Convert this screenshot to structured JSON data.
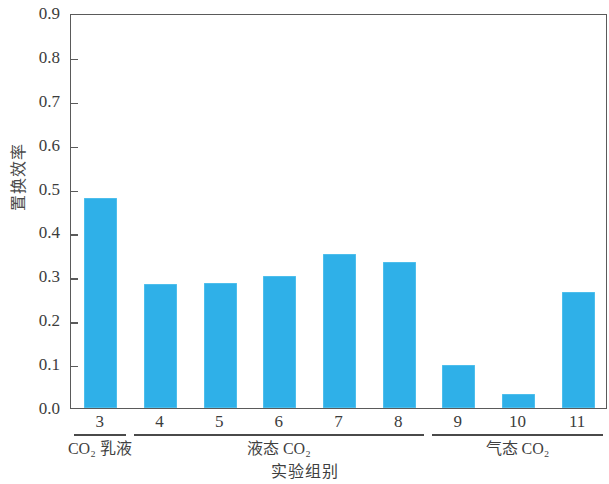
{
  "chart_data": {
    "type": "bar",
    "title": "",
    "xlabel": "实验组别",
    "ylabel": "置换效率",
    "categories": [
      "3",
      "4",
      "5",
      "6",
      "7",
      "8",
      "9",
      "10",
      "11"
    ],
    "values": [
      0.478,
      0.283,
      0.284,
      0.3,
      0.35,
      0.332,
      0.098,
      0.032,
      0.264
    ],
    "series": [
      {
        "name": "置换效率",
        "values": [
          0.478,
          0.283,
          0.284,
          0.3,
          0.35,
          0.332,
          0.098,
          0.032,
          0.264
        ]
      }
    ],
    "ylim": [
      0.0,
      0.9
    ],
    "ytick_labels": [
      "0.0",
      "0.1",
      "0.2",
      "0.3",
      "0.4",
      "0.5",
      "0.6",
      "0.7",
      "0.8",
      "0.9"
    ],
    "ytick_values": [
      0.0,
      0.1,
      0.2,
      0.3,
      0.4,
      0.5,
      0.6,
      0.7,
      0.8,
      0.9
    ],
    "grid": false,
    "legend": null,
    "bar_color": "#2fb0e8",
    "axis_color": "#5a5a5a",
    "groups": [
      {
        "label": "CO₂ 乳液",
        "categories": [
          "3"
        ]
      },
      {
        "label": "液态 CO₂",
        "categories": [
          "4",
          "5",
          "6",
          "7",
          "8"
        ]
      },
      {
        "label": "气态 CO₂",
        "categories": [
          "9",
          "10",
          "11"
        ]
      }
    ]
  },
  "axes": {
    "y_title": "置换效率",
    "x_title": "实验组别"
  },
  "group_labels": {
    "co2_emulsion": "CO₂ 乳液",
    "liquid_co2": "液态 CO₂",
    "gaseous_co2": "气态 CO₂"
  }
}
